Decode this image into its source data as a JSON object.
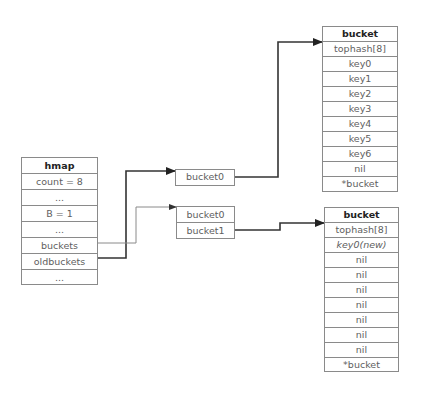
{
  "hmap": {
    "title": "hmap",
    "fields": [
      "count = 8",
      "...",
      "B = 1",
      "...",
      "buckets",
      "oldbuckets",
      "..."
    ]
  },
  "old_bucket_array": {
    "items": [
      "bucket0"
    ]
  },
  "new_bucket_array": {
    "items": [
      "bucket0",
      "bucket1"
    ]
  },
  "old_bucket": {
    "title": "bucket",
    "fields": [
      "tophash[8]",
      "key0",
      "key1",
      "key2",
      "key3",
      "key4",
      "key5",
      "key6",
      "nil",
      "*bucket"
    ]
  },
  "new_bucket": {
    "title": "bucket",
    "fields": [
      "tophash[8]",
      "key0(new)",
      "nil",
      "nil",
      "nil",
      "nil",
      "nil",
      "nil",
      "nil",
      "*bucket"
    ]
  },
  "connectors": [
    {
      "from": "hmap.oldbuckets",
      "to": "old_bucket_array",
      "style": "thick",
      "color": "#333333"
    },
    {
      "from": "hmap.buckets",
      "to": "new_bucket_array",
      "style": "thin",
      "color": "#8a8a8a"
    },
    {
      "from": "old_bucket_array.bucket0",
      "to": "old_bucket",
      "style": "thick",
      "color": "#333333"
    },
    {
      "from": "new_bucket_array.bucket1",
      "to": "new_bucket",
      "style": "thick",
      "color": "#333333"
    }
  ]
}
